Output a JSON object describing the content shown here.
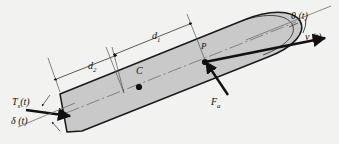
{
  "figure": {
    "type": "ship-steering-dynamics-diagram",
    "background_color": "#f2f2f0",
    "hull_fill_color": "#c9c9c9",
    "hull_stroke_color": "#1a1a1a",
    "line_color": "#111111",
    "thin_line_color": "#555555"
  },
  "labels": {
    "heading_angle": "θ (t)",
    "velocity": "v (t)",
    "distance_1": "d",
    "distance_1_sub": "1",
    "distance_2": "d",
    "distance_2_sub": "2",
    "center_of_mass": "C",
    "point_p": "P",
    "rudder_force": "F",
    "rudder_force_sub": "a",
    "steering_torque": "T",
    "steering_torque_sub": "s",
    "steering_torque_arg": "(t)",
    "rudder_angle": "δ (t)"
  },
  "annotations": {
    "center_of_mass_marker": "filled-dot",
    "point_p_marker": "filled-dot",
    "heading_arc": "theta-arc",
    "velocity_arrow": "arrow",
    "rudder_force_arrow": "arrow",
    "steering_torque_arrow": "arrow",
    "dimension_d1": "double-ended-dimension",
    "dimension_d2": "double-ended-dimension"
  }
}
